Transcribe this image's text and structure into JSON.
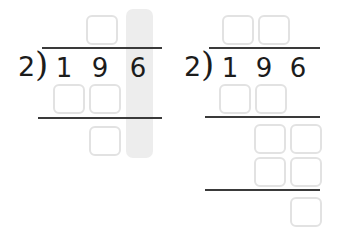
{
  "worksheet": {
    "title": "Long division practice — 196 divided by 2",
    "colors": {
      "ink": "#1c1c1c",
      "rule": "#3a3a3a",
      "box_border": "#e2e2e2",
      "highlight": "#ededed",
      "page": "#ffffff"
    }
  },
  "problems": [
    {
      "id": "problem-left",
      "divisor": "2",
      "paren": ")",
      "dividend_digits": [
        "1",
        "9",
        "6"
      ],
      "highlight": {
        "column": "ones",
        "digit": "6"
      },
      "quotient_boxes": [
        {
          "value": ""
        }
      ],
      "partial_product_boxes": [
        {
          "value": ""
        },
        {
          "value": ""
        }
      ],
      "remainder_boxes": [
        {
          "value": ""
        }
      ]
    },
    {
      "id": "problem-right",
      "divisor": "2",
      "paren": ")",
      "dividend_digits": [
        "1",
        "9",
        "6"
      ],
      "quotient_boxes": [
        {
          "value": ""
        },
        {
          "value": ""
        }
      ],
      "partial_product_boxes": [
        {
          "value": ""
        },
        {
          "value": ""
        }
      ],
      "bring_down_boxes": [
        {
          "value": ""
        },
        {
          "value": ""
        },
        {
          "value": ""
        },
        {
          "value": ""
        }
      ],
      "remainder_boxes": [
        {
          "value": ""
        }
      ]
    }
  ]
}
